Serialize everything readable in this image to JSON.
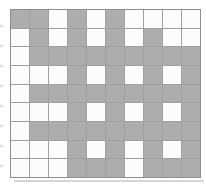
{
  "grid": {
    "columns": 10,
    "rows": 9,
    "filled_symbol": "G",
    "empty_symbol": "W",
    "pattern": [
      "GGWGWGWWWW",
      "WGWGWGWGWW",
      "WGGGGGGGGG",
      "WWWGWGWGWG",
      "WGGGGGGGGG",
      "WWWGWGWGWG",
      "WGGGGGGGGG",
      "WWWGWGWGWG",
      "WWWGGGWGGG"
    ],
    "colors": {
      "filled": "#ADADAD",
      "empty": "#FCFCFC",
      "grid_line": "#A0A0A0",
      "border": "#8E8E8E",
      "background": "#FFFFFF",
      "shadow": "#D6D6D6",
      "edge_mark": "#DCDCDC"
    }
  },
  "edge_marks": {
    "count": 8
  }
}
